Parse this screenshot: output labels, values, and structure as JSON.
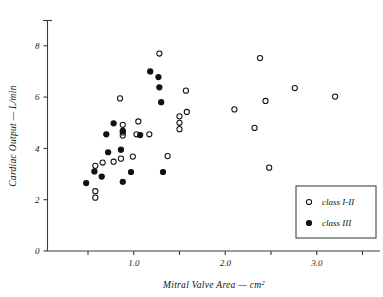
{
  "chart_data": {
    "type": "scatter",
    "title": "",
    "xlabel": "Mitral Valve Area — cm²",
    "ylabel": "Cardiac Output — L/min",
    "xlim": [
      0.35,
      3.6
    ],
    "ylim": [
      0,
      9.0
    ],
    "grid": false,
    "legend_position": "bottom-right",
    "xticks_major": [
      "1.0",
      "2.0",
      "3.0"
    ],
    "xticks_major_values": [
      1.0,
      2.0,
      3.0
    ],
    "xticks_minor_values": [
      0.5,
      1.5,
      2.5,
      3.5
    ],
    "yticks": [
      "0",
      "2",
      "4",
      "6",
      "8"
    ],
    "ytick_values": [
      0,
      2,
      4,
      6,
      8
    ],
    "series": [
      {
        "name": "class I-II",
        "marker": "open-circle",
        "color": "#111111",
        "points": [
          [
            0.58,
            3.32
          ],
          [
            0.58,
            2.33
          ],
          [
            0.58,
            2.08
          ],
          [
            0.66,
            3.45
          ],
          [
            0.78,
            3.48
          ],
          [
            0.85,
            5.95
          ],
          [
            0.86,
            3.6
          ],
          [
            0.88,
            4.92
          ],
          [
            0.88,
            4.5
          ],
          [
            0.88,
            4.62
          ],
          [
            0.99,
            3.68
          ],
          [
            1.05,
            5.05
          ],
          [
            1.03,
            4.55
          ],
          [
            1.17,
            4.55
          ],
          [
            1.28,
            7.7
          ],
          [
            1.37,
            3.7
          ],
          [
            1.5,
            5.25
          ],
          [
            1.5,
            5.0
          ],
          [
            1.5,
            4.75
          ],
          [
            1.57,
            6.25
          ],
          [
            1.58,
            5.42
          ],
          [
            2.1,
            5.52
          ],
          [
            2.32,
            4.8
          ],
          [
            2.38,
            7.52
          ],
          [
            2.44,
            5.85
          ],
          [
            2.48,
            3.25
          ],
          [
            2.76,
            6.35
          ],
          [
            3.2,
            6.02
          ]
        ]
      },
      {
        "name": "class III",
        "marker": "filled-circle",
        "color": "#111111",
        "points": [
          [
            0.48,
            2.65
          ],
          [
            0.57,
            3.1
          ],
          [
            0.65,
            2.9
          ],
          [
            0.7,
            4.55
          ],
          [
            0.72,
            3.85
          ],
          [
            0.78,
            4.98
          ],
          [
            0.86,
            3.95
          ],
          [
            0.88,
            4.68
          ],
          [
            0.88,
            2.7
          ],
          [
            0.97,
            3.08
          ],
          [
            1.07,
            4.52
          ],
          [
            1.18,
            7.0
          ],
          [
            1.27,
            6.78
          ],
          [
            1.28,
            6.38
          ],
          [
            1.3,
            5.8
          ],
          [
            1.32,
            3.08
          ]
        ]
      }
    ]
  },
  "legend": {
    "entries": [
      {
        "marker": "open-circle",
        "label": "class I-II"
      },
      {
        "marker": "filled-circle",
        "label": "class III"
      }
    ]
  }
}
